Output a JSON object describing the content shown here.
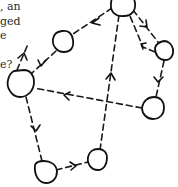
{
  "text_fragment": {
    "lines": [
      ", an",
      "ged",
      "e",
      "",
      "e?"
    ]
  },
  "diagram": {
    "type": "directed-graph",
    "style": "hand-drawn nodes with dashed directed edges",
    "colors": {
      "stroke": "#111111",
      "background": "#ffffff",
      "text": "#2a2a2a"
    },
    "nodes": [
      {
        "id": "A",
        "cx": 123,
        "cy": 3,
        "r": 12
      },
      {
        "id": "B",
        "cx": 63,
        "cy": 42,
        "r": 11
      },
      {
        "id": "C",
        "cx": 164,
        "cy": 51,
        "r": 10
      },
      {
        "id": "D",
        "cx": 20,
        "cy": 84,
        "r": 14
      },
      {
        "id": "E",
        "cx": 153,
        "cy": 108,
        "r": 11
      },
      {
        "id": "F",
        "cx": 45,
        "cy": 173,
        "r": 11
      },
      {
        "id": "G",
        "cx": 98,
        "cy": 160,
        "r": 10
      }
    ],
    "edges": [
      {
        "from": "A",
        "to": "B"
      },
      {
        "from": "B",
        "to": "D"
      },
      {
        "from": "D",
        "to": "B"
      },
      {
        "from": "A",
        "to": "C"
      },
      {
        "from": "C",
        "to": "A"
      },
      {
        "from": "C",
        "to": "E"
      },
      {
        "from": "E",
        "to": "D"
      },
      {
        "from": "D",
        "to": "F"
      },
      {
        "from": "F",
        "to": "G"
      },
      {
        "from": "G",
        "to": "A"
      }
    ]
  }
}
